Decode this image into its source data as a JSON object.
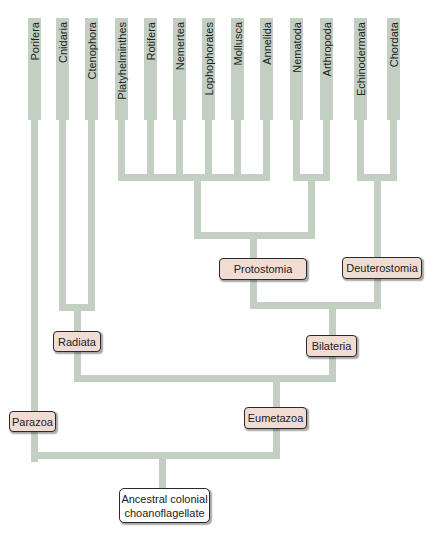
{
  "diagram": {
    "type": "phylogenetic-tree",
    "branch_color": "#c3cfc3",
    "clade_box_color": "#f0dcd2",
    "taxa": [
      {
        "label": "Porifera",
        "x": 34
      },
      {
        "label": "Cnidaria",
        "x": 62
      },
      {
        "label": "Ctenophora",
        "x": 91
      },
      {
        "label": "Platyhelminthes",
        "x": 121
      },
      {
        "label": "Rotifera",
        "x": 150
      },
      {
        "label": "Nemertea",
        "x": 179
      },
      {
        "label": "Lophophorates",
        "x": 208
      },
      {
        "label": "Mollusca",
        "x": 237
      },
      {
        "label": "Annelida",
        "x": 266
      },
      {
        "label": "Nematoda",
        "x": 296
      },
      {
        "label": "Arthropoda",
        "x": 326
      },
      {
        "label": "Echinodermata",
        "x": 360
      },
      {
        "label": "Chordata",
        "x": 393
      }
    ],
    "clades": {
      "protostomia": "Protostomia",
      "deuterostomia": "Deuterostomia",
      "radiata": "Radiata",
      "bilateria": "Bilateria",
      "parazoa": "Parazoa",
      "eumetazoa": "Eumetazoa"
    },
    "root": {
      "line1": "Ancestral colonial",
      "line2": "choanoflagellate"
    }
  }
}
